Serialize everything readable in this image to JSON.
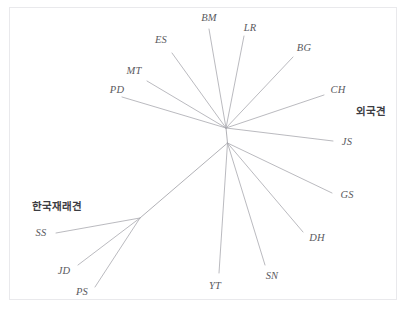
{
  "figure": {
    "type": "unrooted-phylogenetic-tree",
    "background_color": "#ffffff",
    "frame_color": "#e9e9ec",
    "branch_color": "#a8a8ae",
    "label_color": "#5a5a60",
    "group_label_color": "#3c3c42",
    "caption_partial": "",
    "width": 409,
    "height": 322
  },
  "chart_data": {
    "type": "tree",
    "title": "",
    "xlabel": "",
    "ylabel": "",
    "grid": false,
    "legend": "none",
    "nodes": [
      {
        "id": "n-upper",
        "name": "upper-internal-node",
        "x": 226,
        "y": 128
      },
      {
        "id": "n-lower",
        "name": "lower-internal-node",
        "x": 227.5,
        "y": 143
      },
      {
        "id": "n-korean",
        "name": "korean-native-clade-node",
        "x": 140,
        "y": 218
      }
    ],
    "edges": [
      {
        "from": "n-upper",
        "to": "n-lower"
      },
      {
        "from": "n-lower",
        "to": "n-korean"
      },
      {
        "from": "n-upper",
        "to": "PD"
      },
      {
        "from": "n-upper",
        "to": "MT"
      },
      {
        "from": "n-upper",
        "to": "ES"
      },
      {
        "from": "n-upper",
        "to": "BM"
      },
      {
        "from": "n-upper",
        "to": "LR"
      },
      {
        "from": "n-upper",
        "to": "BG"
      },
      {
        "from": "n-upper",
        "to": "CH"
      },
      {
        "from": "n-upper",
        "to": "JS"
      },
      {
        "from": "n-lower",
        "to": "GS"
      },
      {
        "from": "n-lower",
        "to": "DH"
      },
      {
        "from": "n-lower",
        "to": "SN"
      },
      {
        "from": "n-lower",
        "to": "YT"
      },
      {
        "from": "n-korean",
        "to": "SS"
      },
      {
        "from": "n-korean",
        "to": "JD"
      },
      {
        "from": "n-korean",
        "to": "PS"
      }
    ],
    "tips": [
      {
        "id": "PD",
        "label": "PD",
        "tip_x": 122,
        "tip_y": 97,
        "label_x": 117,
        "label_y": 89,
        "group": "foreign"
      },
      {
        "id": "MT",
        "label": "MT",
        "tip_x": 147,
        "tip_y": 81,
        "label_x": 134,
        "label_y": 70,
        "group": "foreign"
      },
      {
        "id": "ES",
        "label": "ES",
        "tip_x": 172,
        "tip_y": 53,
        "label_x": 161,
        "label_y": 39,
        "group": "foreign"
      },
      {
        "id": "BM",
        "label": "BM",
        "tip_x": 209,
        "tip_y": 29,
        "label_x": 209,
        "label_y": 17,
        "group": "foreign"
      },
      {
        "id": "LR",
        "label": "LR",
        "tip_x": 244,
        "tip_y": 36,
        "label_x": 250,
        "label_y": 27,
        "group": "foreign"
      },
      {
        "id": "BG",
        "label": "BG",
        "tip_x": 293,
        "tip_y": 57,
        "label_x": 304,
        "label_y": 47,
        "group": "foreign"
      },
      {
        "id": "CH",
        "label": "CH",
        "tip_x": 324,
        "tip_y": 95,
        "label_x": 338,
        "label_y": 89,
        "group": "foreign"
      },
      {
        "id": "JS",
        "label": "JS",
        "tip_x": 333,
        "tip_y": 141,
        "label_x": 347,
        "label_y": 141,
        "group": "foreign"
      },
      {
        "id": "GS",
        "label": "GS",
        "tip_x": 332,
        "tip_y": 193,
        "label_x": 347,
        "label_y": 194,
        "group": "foreign"
      },
      {
        "id": "DH",
        "label": "DH",
        "tip_x": 303,
        "tip_y": 232,
        "label_x": 317,
        "label_y": 237,
        "group": "foreign"
      },
      {
        "id": "SN",
        "label": "SN",
        "tip_x": 265,
        "tip_y": 265,
        "label_x": 272,
        "label_y": 275,
        "group": "foreign"
      },
      {
        "id": "YT",
        "label": "YT",
        "tip_x": 219,
        "tip_y": 273,
        "label_x": 215,
        "label_y": 285,
        "group": "foreign"
      },
      {
        "id": "SS",
        "label": "SS",
        "tip_x": 56,
        "tip_y": 233,
        "label_x": 41,
        "label_y": 232,
        "group": "korean"
      },
      {
        "id": "JD",
        "label": "JD",
        "tip_x": 78,
        "tip_y": 265,
        "label_x": 64,
        "label_y": 270,
        "group": "korean"
      },
      {
        "id": "PS",
        "label": "PS",
        "tip_x": 95,
        "tip_y": 287,
        "label_x": 82,
        "label_y": 291,
        "group": "korean"
      }
    ],
    "group_annotations": [
      {
        "id": "korean-native",
        "label": "한국재래견",
        "x": 57,
        "y": 205
      },
      {
        "id": "foreign",
        "label": "외국견",
        "x": 371,
        "y": 110
      }
    ]
  }
}
